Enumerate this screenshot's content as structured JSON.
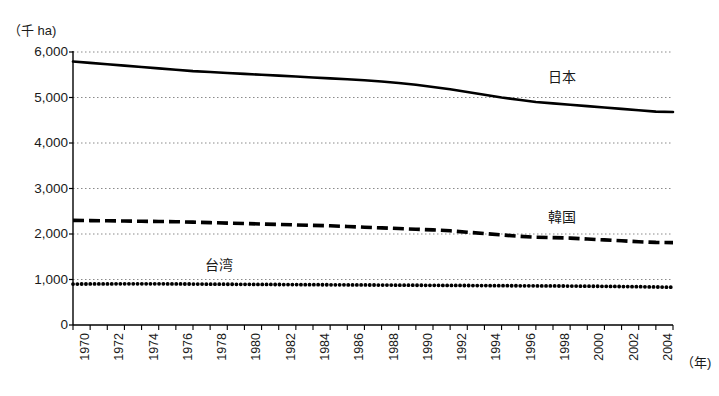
{
  "chart_data": {
    "type": "line",
    "title": "",
    "ylabel": "（千 ha)",
    "xlabel": "（年)",
    "ylim": [
      0,
      6000
    ],
    "xlim": [
      1970,
      2005
    ],
    "grid": true,
    "grid_style": "dotted-horizontal",
    "legend": "inline-labels-at-right",
    "ytick_labels": [
      "6,000",
      "5,000",
      "4,000",
      "3,000",
      "2,000",
      "1,000",
      "0"
    ],
    "ytick_values": [
      6000,
      5000,
      4000,
      3000,
      2000,
      1000,
      0
    ],
    "xtick_labels": [
      "1970",
      "1972",
      "1974",
      "1976",
      "1978",
      "1980",
      "1982",
      "1984",
      "1986",
      "1988",
      "1990",
      "1992",
      "1994",
      "1996",
      "1998",
      "2000",
      "2002",
      "2004"
    ],
    "xtick_values": [
      1970,
      1972,
      1974,
      1976,
      1978,
      1980,
      1982,
      1984,
      1986,
      1988,
      1990,
      1992,
      1994,
      1996,
      1998,
      2000,
      2002,
      2004
    ],
    "x": [
      1970,
      1971,
      1972,
      1973,
      1974,
      1975,
      1976,
      1977,
      1978,
      1979,
      1980,
      1981,
      1982,
      1983,
      1984,
      1985,
      1986,
      1987,
      1988,
      1989,
      1990,
      1991,
      1992,
      1993,
      1994,
      1995,
      1996,
      1997,
      1998,
      1999,
      2000,
      2001,
      2002,
      2003,
      2004,
      2005
    ],
    "series": [
      {
        "name": "日本",
        "style": "solid",
        "color": "#000000",
        "label_x": 548,
        "label_y": 70,
        "values": [
          5790,
          5760,
          5730,
          5700,
          5670,
          5640,
          5610,
          5580,
          5560,
          5540,
          5520,
          5500,
          5480,
          5460,
          5440,
          5420,
          5400,
          5380,
          5350,
          5320,
          5280,
          5230,
          5180,
          5120,
          5060,
          5000,
          4950,
          4900,
          4870,
          4840,
          4810,
          4780,
          4750,
          4720,
          4690,
          4680
        ]
      },
      {
        "name": "韓国",
        "style": "dashed",
        "color": "#000000",
        "label_x": 548,
        "label_y": 210,
        "values": [
          2300,
          2295,
          2290,
          2285,
          2280,
          2275,
          2270,
          2260,
          2250,
          2240,
          2230,
          2220,
          2210,
          2200,
          2190,
          2180,
          2165,
          2150,
          2135,
          2120,
          2105,
          2090,
          2070,
          2040,
          2010,
          1980,
          1950,
          1930,
          1920,
          1910,
          1890,
          1870,
          1850,
          1830,
          1815,
          1810
        ]
      },
      {
        "name": "台湾",
        "style": "dotted",
        "color": "#000000",
        "label_x": 205,
        "label_y": 258,
        "values": [
          900,
          902,
          903,
          905,
          905,
          905,
          903,
          900,
          898,
          896,
          894,
          892,
          890,
          888,
          886,
          884,
          882,
          880,
          878,
          876,
          874,
          872,
          870,
          868,
          866,
          864,
          862,
          860,
          858,
          856,
          853,
          850,
          846,
          842,
          836,
          830
        ]
      }
    ]
  }
}
